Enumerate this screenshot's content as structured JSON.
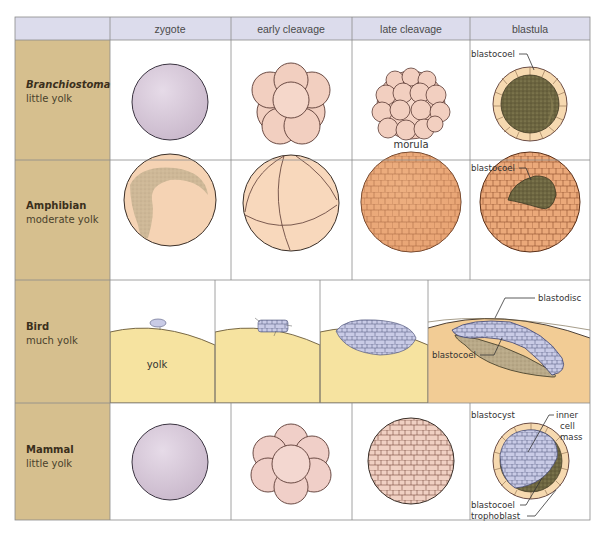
{
  "table": {
    "columns": [
      {
        "key": "zygote",
        "label": "zygote"
      },
      {
        "key": "early_cleavage",
        "label": "early cleavage"
      },
      {
        "key": "late_cleavage",
        "label": "late cleavage"
      },
      {
        "key": "blastula",
        "label": "blastula"
      }
    ],
    "rows": [
      {
        "key": "branchiostoma",
        "title": "Branchiostoma",
        "title_italic": true,
        "subtitle": "little yolk"
      },
      {
        "key": "amphibian",
        "title": "Amphibian",
        "title_italic": false,
        "subtitle": "moderate yolk"
      },
      {
        "key": "bird",
        "title": "Bird",
        "title_italic": false,
        "subtitle": "much yolk"
      },
      {
        "key": "mammal",
        "title": "Mammal",
        "title_italic": false,
        "subtitle": "little yolk"
      }
    ]
  },
  "labels": {
    "branchiostoma_late_cleavage": "morula",
    "branchiostoma_blastula": "blastocoel",
    "amphibian_blastula": "blastocoel",
    "bird_zygote": "yolk",
    "bird_blastula_top": "blastodisc",
    "bird_blastula_bottom": "blastocoel",
    "mammal_blastula_title": "blastocyst",
    "mammal_inner_1": "inner",
    "mammal_inner_2": "cell",
    "mammal_inner_3": "mass",
    "mammal_blastocoel": "blastocoel",
    "mammal_trophoblast": "trophoblast"
  },
  "colors": {
    "header_bg": "#dcdcec",
    "label_col_bg": "#d6bf8e",
    "cell_bg": "#ffffff",
    "grid": "#8a8a8a",
    "zygote_lilac": "#d9c9d9",
    "peach_cell": "#f2cfc0",
    "amphibian_orange": "#eba97a",
    "amphibian_zygote": "#f5d3b4",
    "yolk_yellow": "#f6e3a0",
    "yolk_orange": "#f2cc95",
    "blastodisc_blue": "#c9cbe6",
    "blastocoel_olive": "#7d7348"
  }
}
